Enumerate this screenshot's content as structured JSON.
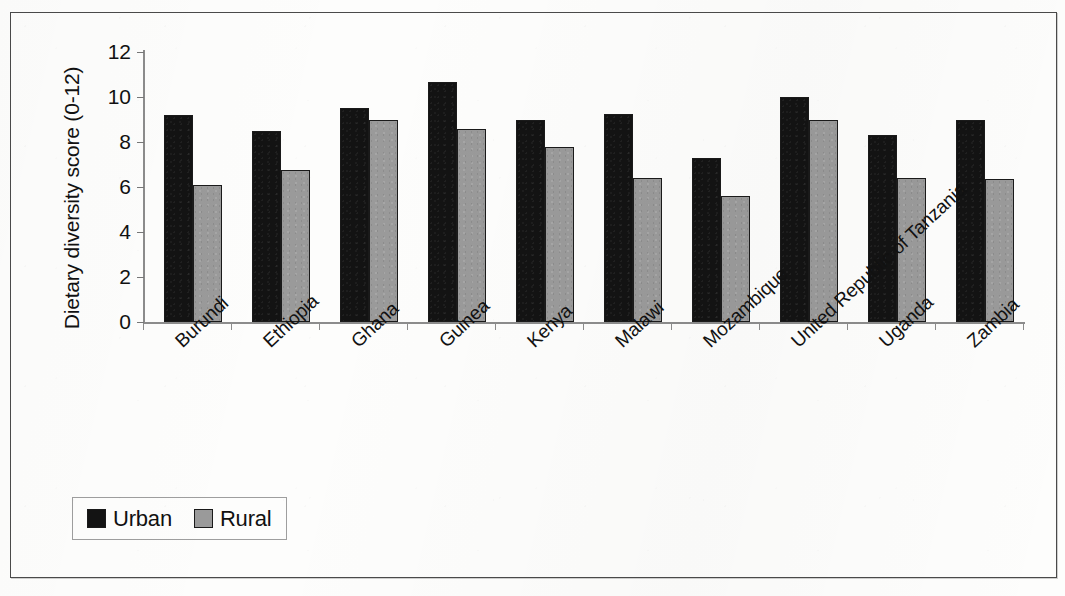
{
  "chart_data": {
    "type": "bar",
    "title": "",
    "xlabel": "",
    "ylabel": "Dietary diversity score (0-12)",
    "ylim": [
      0,
      12
    ],
    "ytick_labels": [
      "12",
      "10",
      "8",
      "6",
      "4",
      "2",
      "0"
    ],
    "ytick_values": [
      12,
      10,
      8,
      6,
      4,
      2,
      0
    ],
    "grid": false,
    "legend_position": "bottom-left",
    "categories": [
      "Burundi",
      "Ethiopia",
      "Ghana",
      "Guinea",
      "Kenya",
      "Malawi",
      "Mozambique",
      "United Republic of Tanzania",
      "Uganda",
      "Zambia"
    ],
    "series": [
      {
        "name": "Urban",
        "color": "#131313",
        "values": [
          9.2,
          8.5,
          9.5,
          10.65,
          9.0,
          9.25,
          7.3,
          10.0,
          8.3,
          9.0
        ]
      },
      {
        "name": "Rural",
        "color": "#9a9a9a",
        "values": [
          6.1,
          6.75,
          9.0,
          8.6,
          7.8,
          6.4,
          5.6,
          9.0,
          6.4,
          6.35
        ]
      }
    ]
  },
  "legend": {
    "items": [
      {
        "label": "Urban",
        "swatch": "black-square-icon"
      },
      {
        "label": "Rural",
        "swatch": "gray-square-icon"
      }
    ]
  }
}
